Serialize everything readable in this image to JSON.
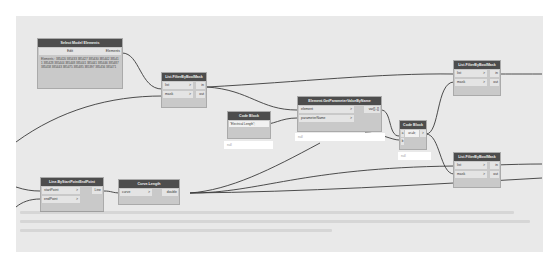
{
  "nodes": {
    "select_model_elements": {
      "title": "Select Model Elements",
      "button_label": "Edit",
      "output": "Elements",
      "preview_list": "Elements : 385420 385433 385427 385430 385442 385411 385428 385444 385448 385441 385441 385446 385487 385458 385443 385475 385485 385397 385456 385471"
    },
    "filter_by_bool_mask_1": {
      "title": "List.FilterByBoolMask",
      "inputs": [
        "list",
        "mask"
      ],
      "outputs": [
        "in",
        "out"
      ]
    },
    "code_block_1": {
      "title": "Code Block",
      "code": "\"Electrical Length\";",
      "preview": "null"
    },
    "get_parameter_value": {
      "title": "Element.GetParameterValueByName",
      "inputs": [
        "element",
        "parameterName"
      ],
      "outputs": [
        "var[]..[]"
      ],
      "preview": "null"
    },
    "code_block_2": {
      "title": "Code Block",
      "inputs": [
        "a",
        "b"
      ],
      "code": "a<=b;",
      "output": ">",
      "preview": "null"
    },
    "filter_by_bool_mask_2": {
      "title": "List.FilterByBoolMask",
      "inputs": [
        "list",
        "mask"
      ],
      "outputs": [
        "in",
        "out"
      ]
    },
    "filter_by_bool_mask_3": {
      "title": "List.FilterByBoolMask",
      "inputs": [
        "list",
        "mask"
      ],
      "outputs": [
        "in",
        "out"
      ]
    },
    "line_by_start_end": {
      "title": "Line.ByStartPointEndPoint",
      "inputs": [
        "startPoint",
        "endPoint"
      ],
      "outputs": [
        "Line"
      ]
    },
    "curve_length": {
      "title": "Curve.Length",
      "inputs": [
        "curve"
      ],
      "outputs": [
        "double"
      ]
    }
  },
  "input_arrow": ">",
  "colors": {
    "canvas": "#e9e9e9",
    "node_header": "#4d4d4d",
    "node_body": "#c9c9c9",
    "port": "#e4e4e4",
    "wire": "#333333"
  }
}
